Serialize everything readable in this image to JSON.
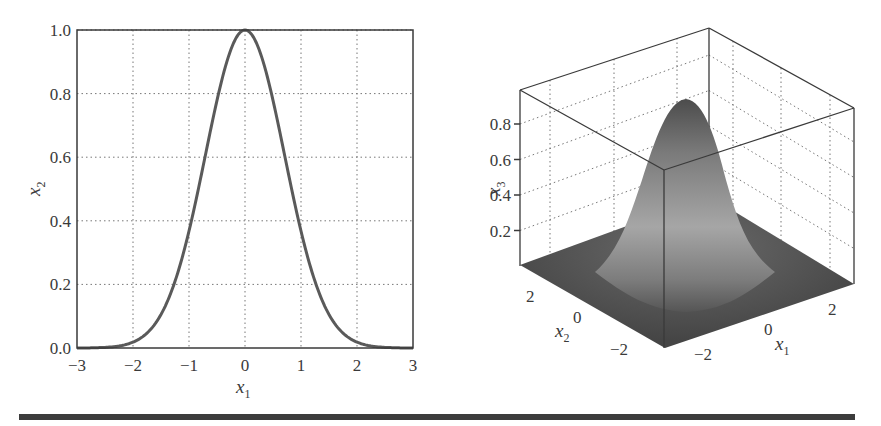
{
  "chart_data": [
    {
      "type": "line",
      "title": "",
      "xlabel": "x1",
      "ylabel": "x2",
      "xlim": [
        -3,
        3
      ],
      "ylim": [
        0,
        1
      ],
      "xticks": [
        -3,
        -2,
        -1,
        0,
        1,
        2,
        3
      ],
      "xtick_labels": [
        "−3",
        "−2",
        "−1",
        "0",
        "1",
        "2",
        "3"
      ],
      "yticks": [
        0,
        0.2,
        0.4,
        0.6,
        0.8,
        1.0
      ],
      "ytick_labels": [
        "0.0",
        "0.2",
        "0.4",
        "0.6",
        "0.8",
        "1.0"
      ],
      "grid": true,
      "grid_style": "dotted",
      "series": [
        {
          "name": "x2 = exp(-x1^2)",
          "x": [
            -3,
            -2.5,
            -2,
            -1.75,
            -1.5,
            -1.25,
            -1,
            -0.75,
            -0.5,
            -0.25,
            0,
            0.25,
            0.5,
            0.75,
            1,
            1.25,
            1.5,
            1.75,
            2,
            2.5,
            3
          ],
          "y": [
            0.0,
            0.002,
            0.018,
            0.047,
            0.105,
            0.21,
            0.368,
            0.57,
            0.779,
            0.939,
            1.0,
            0.939,
            0.779,
            0.57,
            0.368,
            0.21,
            0.105,
            0.047,
            0.018,
            0.002,
            0.0
          ],
          "color": "#5a5a5a"
        }
      ]
    },
    {
      "type": "surface",
      "title": "",
      "xlabel": "x1",
      "ylabel": "x2",
      "zlabel": "x3",
      "xlim": [
        -3,
        3
      ],
      "ylim": [
        -3,
        3
      ],
      "zlim": [
        0,
        1
      ],
      "xtick_labels": [
        "−2",
        "0",
        "2"
      ],
      "ytick_labels": [
        "2",
        "0",
        "−2"
      ],
      "ztick_labels": [
        "0.2",
        "0.4",
        "0.6",
        "0.8"
      ],
      "zticks": [
        0.2,
        0.4,
        0.6,
        0.8
      ],
      "grid": true,
      "function": "x3 = exp(-(x1^2 + x2^2))",
      "peak": 1.0,
      "colormap": "grayscale"
    }
  ],
  "left_plot": {
    "xlabel_main": "x",
    "xlabel_sub": "1",
    "ylabel_main": "x",
    "ylabel_sub": "2"
  },
  "right_plot": {
    "x1_label_main": "x",
    "x1_label_sub": "1",
    "x2_label_main": "x",
    "x2_label_sub": "2",
    "x3_label_main": "x",
    "x3_label_sub": "3"
  },
  "colors": {
    "axis": "#3a3a3a",
    "curve": "#5a5a5a",
    "grid": "#777777",
    "surface_dark": "#4a4a4a",
    "surface_light": "#a8a8a8",
    "rule": "#3c3c3c"
  }
}
